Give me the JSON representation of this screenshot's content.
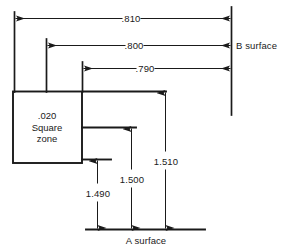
{
  "drawing": {
    "title": "Dimensional tolerance drawing",
    "horizontal_dimensions": [
      {
        "name": "dim-810",
        "value": ".810"
      },
      {
        "name": "dim-800",
        "value": ".800"
      },
      {
        "name": "dim-790",
        "value": ".790"
      }
    ],
    "vertical_dimensions": [
      {
        "name": "dim-1490",
        "value": "1.490"
      },
      {
        "name": "dim-1500",
        "value": "1.500"
      },
      {
        "name": "dim-1510",
        "value": "1.510"
      }
    ],
    "datums": {
      "b_surface": "B surface",
      "a_surface": "A surface"
    },
    "tolerance_zone": {
      "size": ".020",
      "line2": "Square",
      "line3": "zone",
      "full": ".020\nSquare\nzone"
    },
    "colors": {
      "line": "#1a1a1a",
      "background": "#ffffff",
      "text": "#1a1a1a"
    }
  }
}
